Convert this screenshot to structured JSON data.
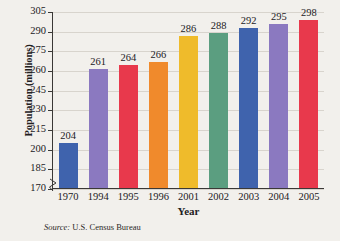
{
  "chart_data": {
    "type": "bar",
    "title": "",
    "xlabel": "Year",
    "ylabel": "Population (millions)",
    "categories": [
      "1970",
      "1994",
      "1995",
      "1996",
      "2001",
      "2002",
      "2003",
      "2004",
      "2005"
    ],
    "values": [
      204,
      261,
      264,
      266,
      286,
      288,
      292,
      295,
      298
    ],
    "value_labels": [
      "204",
      "261",
      "264",
      "266",
      "286",
      "288",
      "292",
      "295",
      "298"
    ],
    "colors": [
      "#3f63ad",
      "#8b79c0",
      "#e8394c",
      "#f08a2c",
      "#efbb2b",
      "#5b9e80",
      "#3f63ad",
      "#8b79c0",
      "#e8394c"
    ],
    "ylim": [
      170,
      305
    ],
    "yticks": [
      170,
      185,
      200,
      215,
      230,
      245,
      260,
      275,
      290,
      305
    ],
    "ytick_labels": [
      "170",
      "185",
      "200",
      "215",
      "230",
      "245",
      "260",
      "275",
      "290",
      "305"
    ],
    "grid": true,
    "axis_break": true,
    "legend": "none",
    "source": {
      "keyword": "Source:",
      "text": "U.S. Census Bureau"
    }
  }
}
